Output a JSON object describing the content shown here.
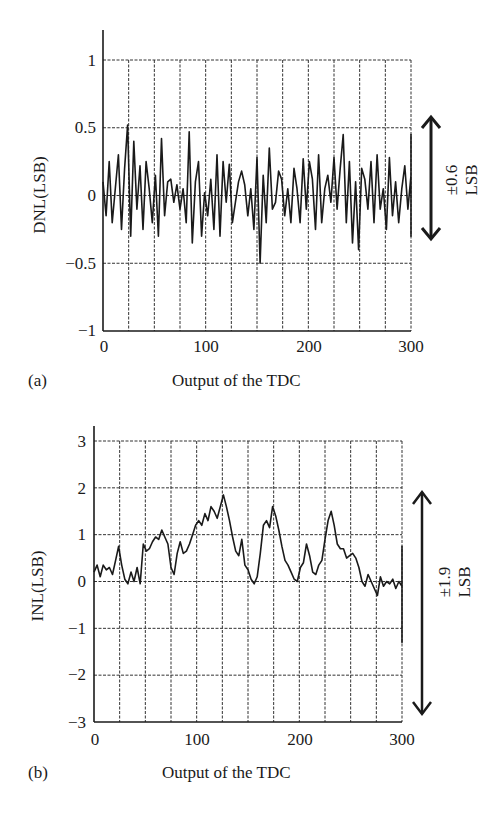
{
  "chart_data": [
    {
      "panel": "(a)",
      "type": "line",
      "xlabel": "Output of the TDC",
      "ylabel": "DNL(LSB)",
      "xlim": [
        0,
        300
      ],
      "ylim": [
        -1,
        1
      ],
      "xticks": [
        "0",
        "100",
        "200",
        "300"
      ],
      "yticks": [
        "1",
        "0.5",
        "0",
        "−0.5",
        "−1"
      ],
      "grid": true,
      "grid_x_step": 25,
      "grid_y_step": 0.5,
      "annotation": {
        "text": "±0.6",
        "unit": "LSB",
        "arrow_range": [
          -0.45,
          0.38
        ]
      },
      "series": [
        {
          "name": "DNL",
          "x_step": 3,
          "values": [
            0.1,
            -0.15,
            0.25,
            -0.2,
            0.05,
            0.3,
            -0.25,
            0.2,
            0.52,
            -0.3,
            0.4,
            -0.1,
            0.22,
            -0.25,
            0.25,
            0.05,
            -0.2,
            0.15,
            -0.3,
            0.42,
            -0.15,
            0.1,
            0.12,
            -0.05,
            0.08,
            -0.1,
            0.05,
            -0.2,
            0.47,
            -0.35,
            0.1,
            0.25,
            -0.3,
            0.02,
            -0.15,
            0.12,
            -0.25,
            0.3,
            -0.3,
            0.25,
            -0.05,
            0.23,
            -0.2,
            -0.05,
            0.1,
            0.18,
            0.08,
            -0.15,
            0.05,
            -0.25,
            0.28,
            -0.5,
            0.15,
            -0.2,
            0.35,
            -0.1,
            -0.05,
            0.18,
            0.12,
            -0.15,
            0.05,
            -0.2,
            0.2,
            0.05,
            -0.2,
            0.27,
            -0.1,
            0.25,
            0.12,
            -0.25,
            0.3,
            -0.2,
            0.05,
            0.15,
            -0.05,
            0.28,
            -0.1,
            0.2,
            0.45,
            -0.2,
            0.25,
            -0.35,
            0.1,
            -0.4,
            0.2,
            0.12,
            -0.1,
            0.25,
            -0.2,
            0.3,
            -0.1,
            0.05,
            -0.25,
            0.28,
            -0.15,
            0.1,
            -0.2,
            0.05,
            0.22,
            -0.1,
            0.15,
            -0.3,
            0.42,
            -0.15,
            0.2,
            -0.1,
            0.15,
            -0.2,
            0.25,
            -0.1,
            0.05,
            0.2,
            -0.25,
            0.3,
            0.1,
            -0.15,
            0.08,
            0.3,
            -0.2,
            0.1,
            0.15,
            -0.25,
            0.22,
            -0.05,
            0.08,
            -0.2,
            0.25,
            -0.15,
            0.05,
            0.18,
            -0.1,
            0.45,
            -0.3,
            0.3,
            0.22,
            -0.25,
            0.12,
            -0.05,
            0.3,
            0.25,
            -0.2,
            0.35,
            0.1,
            -0.25,
            0.25,
            0.2,
            -0.3
          ]
        }
      ]
    },
    {
      "panel": "(b)",
      "type": "line",
      "xlabel": "Output of the TDC",
      "ylabel": "INL(LSB)",
      "xlim": [
        0,
        300
      ],
      "ylim": [
        -3,
        3
      ],
      "xticks": [
        "0",
        "100",
        "200",
        "300"
      ],
      "yticks": [
        "3",
        "2",
        "1",
        "0",
        "−1",
        "−2",
        "−3"
      ],
      "grid": true,
      "grid_x_step": 25,
      "grid_y_step": 1,
      "annotation": {
        "text": "±1.9",
        "unit": "LSB",
        "arrow_range": [
          -1.9,
          2.2
        ]
      },
      "series": [
        {
          "name": "INL",
          "x_step": 3,
          "values": [
            0.2,
            0.35,
            0.1,
            0.35,
            0.25,
            0.3,
            0.15,
            0.45,
            0.75,
            0.35,
            0.05,
            -0.05,
            0.2,
            0.0,
            0.3,
            -0.05,
            0.8,
            0.65,
            0.7,
            0.85,
            0.95,
            0.9,
            1.1,
            0.95,
            0.8,
            0.3,
            0.15,
            0.6,
            0.85,
            0.6,
            0.65,
            0.8,
            1.0,
            1.2,
            1.3,
            1.2,
            1.45,
            1.3,
            1.6,
            1.5,
            1.35,
            1.6,
            1.85,
            1.6,
            1.3,
            0.95,
            0.65,
            0.55,
            0.9,
            0.35,
            0.25,
            0.05,
            -0.05,
            0.1,
            0.6,
            1.2,
            1.3,
            1.15,
            1.6,
            1.4,
            1.1,
            0.75,
            0.45,
            0.35,
            0.2,
            0.05,
            0.0,
            0.3,
            0.4,
            0.8,
            0.55,
            0.2,
            0.15,
            0.35,
            0.45,
            0.9,
            1.3,
            1.5,
            1.2,
            0.8,
            0.7,
            0.7,
            0.5,
            0.55,
            0.6,
            0.5,
            0.3,
            0.0,
            -0.1,
            0.15,
            0.0,
            -0.15,
            -0.3,
            0.1,
            -0.1,
            0.0,
            -0.05,
            0.05,
            -0.15,
            0.0,
            -0.1,
            0.0,
            -0.25,
            -0.6,
            -1.0,
            -1.1,
            -1.1,
            -0.8,
            -0.65,
            -1.0,
            -0.8,
            -0.9,
            -0.85,
            -1.0,
            -0.95,
            -1.05,
            -1.1,
            -1.0,
            -0.8,
            -0.7,
            -0.95,
            -1.25,
            -1.3,
            -1.1,
            -1.0,
            -1.1,
            -1.1,
            -1.15,
            -1.25,
            -0.85,
            -0.9,
            -0.8,
            -0.75,
            -0.8,
            -0.5,
            -0.2,
            0.3,
            0.55,
            0.75,
            0.4,
            0.6,
            0.5,
            0.55,
            0.5,
            0.3
          ]
        }
      ]
    }
  ],
  "panels": {
    "a": {
      "label": "(a)",
      "ylabel": "DNL(LSB)",
      "xlabel": "Output of the TDC",
      "yticks": [
        "1",
        "0.5",
        "0",
        "−0.5",
        "−1"
      ],
      "xticks": [
        "0",
        "100",
        "200",
        "300"
      ],
      "range_value": "±0.6",
      "range_unit": "LSB"
    },
    "b": {
      "label": "(b)",
      "ylabel": "INL(LSB)",
      "xlabel": "Output of the TDC",
      "yticks": [
        "3",
        "2",
        "1",
        "0",
        "−1",
        "−2",
        "−3"
      ],
      "xticks": [
        "0",
        "100",
        "200",
        "300"
      ],
      "range_value": "±1.9",
      "range_unit": "LSB"
    }
  },
  "colors": {
    "line": "#1a1a1a",
    "grid": "#333333",
    "background": "#ffffff"
  }
}
